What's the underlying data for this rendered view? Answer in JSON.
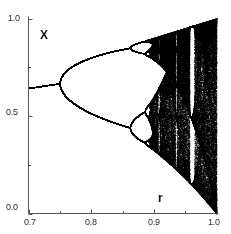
{
  "figure": {
    "kind": "bifurcation-diagram",
    "background_color": "#ffffff",
    "ink_color": "#000000"
  },
  "axes": {
    "x_axis_name": "r",
    "y_axis_name": "X",
    "x_tick_labels": [
      "0.7",
      "0.8",
      "0.9",
      "1.0"
    ],
    "y_tick_labels": [
      "1.0",
      "0.5",
      "0.0"
    ]
  },
  "chart_data": {
    "type": "scatter",
    "title": "",
    "subtitle": "",
    "xlabel": "r",
    "ylabel": "X",
    "xlim": [
      0.7,
      1.0
    ],
    "ylim": [
      0.0,
      1.0
    ],
    "xticks": [
      0.7,
      0.8,
      0.9,
      1.0
    ],
    "xticks_minor": [
      0.75,
      0.85,
      0.95
    ],
    "yticks": [
      0.0,
      0.5,
      1.0
    ],
    "yticks_minor": [
      0.25,
      0.75
    ],
    "grid": false,
    "legend": false,
    "legend_position": "none",
    "map_formula": "x_{n+1} = 4*r*x_n*(1 - x_n)",
    "scale_factor": 4,
    "iterations_transient": 300,
    "iterations_plotted": 260,
    "r_samples": 900,
    "annotations": [
      {
        "text": "X",
        "x": 0.715,
        "y": 0.95,
        "role": "y-axis-name"
      },
      {
        "text": "r",
        "x": 0.932,
        "y": 0.115,
        "role": "x-axis-name"
      }
    ],
    "features": [
      {
        "name": "period-1 fixed point",
        "r_range": [
          0.7,
          0.75
        ],
        "x_values": [
          0.69
        ]
      },
      {
        "name": "first bifurcation (period 2)",
        "r": 0.75
      },
      {
        "name": "second bifurcation (period 4)",
        "r": 0.8623
      },
      {
        "name": "third bifurcation (period 8)",
        "r": 0.886
      },
      {
        "name": "accumulation point (onset of chaos)",
        "r": 0.89249
      },
      {
        "name": "period-3 window",
        "r_range": [
          0.9575,
          0.9624
        ]
      },
      {
        "name": "period-5 window",
        "r_range": [
          0.9345,
          0.9375
        ]
      },
      {
        "name": "period-6 window",
        "r_range": [
          0.906,
          0.9075
        ]
      },
      {
        "name": "upper envelope at r=1.0",
        "x": 1.0
      },
      {
        "name": "lower envelope at r=1.0",
        "x": 0.0
      }
    ]
  }
}
